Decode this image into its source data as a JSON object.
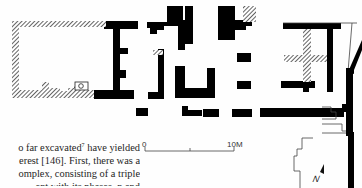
{
  "figure": {
    "type": "archaeological site plan",
    "scale_bar": {
      "start_label": "0",
      "end_label": "10M"
    },
    "north_arrow": {
      "label": "N"
    },
    "colors": {
      "wall_solid": "#000000",
      "wall_hatched": "#000000",
      "paper": "#fefefe",
      "outline": "#333333"
    }
  },
  "body_text": {
    "lines": [
      {
        "pre": "o far excavated",
        "note": "7",
        "post": " have yielded"
      },
      {
        "pre": "erest [146]. First, there was a",
        "note": "",
        "post": ""
      },
      {
        "pre": "omplex, consisting of a triple",
        "note": "",
        "post": ""
      },
      {
        "pre": "ent with its phases. n  and",
        "note": "",
        "post": ""
      }
    ]
  }
}
